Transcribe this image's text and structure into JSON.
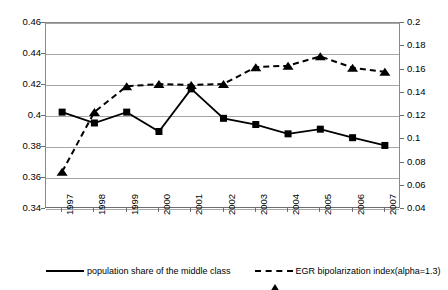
{
  "chart_data": {
    "type": "line",
    "title": "",
    "xlabel": "",
    "ylabel": "",
    "grid": true,
    "legend_position": "bottom",
    "categories": [
      "1997",
      "1998",
      "1999",
      "2000",
      "2001",
      "2002",
      "2003",
      "2004",
      "2005",
      "2006",
      "2007"
    ],
    "axes": {
      "left": {
        "label": "",
        "ylim": [
          0.34,
          0.46
        ],
        "tick_step": 0.02,
        "ticks": [
          "0.34",
          "0.36",
          "0.38",
          "0.4",
          "0.42",
          "0.44",
          "0.46"
        ]
      },
      "right": {
        "label": "",
        "ylim": [
          0.04,
          0.2
        ],
        "tick_step": 0.02,
        "ticks": [
          "0.04",
          "0.06",
          "0.08",
          "0.1",
          "0.12",
          "0.14",
          "0.16",
          "0.18",
          "0.2"
        ]
      }
    },
    "series": [
      {
        "name": "population share of the middle class",
        "axis": "left",
        "marker": "square",
        "line": "solid",
        "color": "#000000",
        "values": [
          0.4025,
          0.3955,
          0.4025,
          0.39,
          0.4175,
          0.3985,
          0.3945,
          0.3885,
          0.3915,
          0.386,
          0.381
        ]
      },
      {
        "name": "EGR bipolarization index(alpha=1.3)",
        "axis": "right",
        "marker": "triangle",
        "line": "dashed",
        "color": "#000000",
        "values": [
          0.072,
          0.1235,
          0.1455,
          0.1475,
          0.1467,
          0.1475,
          0.162,
          0.1633,
          0.1713,
          0.1615,
          0.158
        ]
      }
    ]
  },
  "legend": {
    "entries": [
      {
        "label": "population share of the middle class",
        "marker": "square-marker-icon",
        "line": "solid"
      },
      {
        "label": "EGR bipolarization index(alpha=1.3)",
        "marker": "triangle-marker-icon",
        "line": "dashed"
      }
    ]
  }
}
